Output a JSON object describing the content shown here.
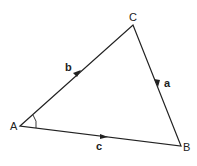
{
  "diagram": {
    "vertices": {
      "A": {
        "label": "A",
        "x": 20,
        "y": 126
      },
      "B": {
        "label": "B",
        "x": 181,
        "y": 146
      },
      "C": {
        "label": "C",
        "x": 133,
        "y": 25
      }
    },
    "sides": {
      "a": {
        "label": "a",
        "from": "C",
        "to": "B"
      },
      "b": {
        "label": "b",
        "from": "A",
        "to": "C"
      },
      "c": {
        "label": "c",
        "from": "A",
        "to": "B"
      }
    },
    "angle_mark": "A",
    "colors": {
      "line": "#222222",
      "background": "#ffffff"
    }
  }
}
